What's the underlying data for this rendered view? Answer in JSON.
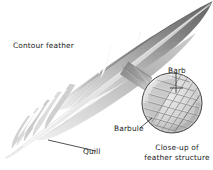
{
  "figure": {
    "background_color": "#ffffff",
    "width": 213,
    "height": 170
  },
  "labels": {
    "contour_feather": "Contour feather",
    "barb": "Barb",
    "barbule": "Barbule",
    "quill": "Quill"
  },
  "caption": {
    "line1": "Close-up of",
    "line2": "feather structure"
  },
  "colors": {
    "ink": "#1a1a1a",
    "vane_dark": "#6e6e6e",
    "vane_mid": "#9d9d9d",
    "vane_light": "#d8d8d8",
    "vane_highlight": "#f2f2f2",
    "rachis": "#e8e8e8",
    "outline": "#555555",
    "leader": "#202020",
    "wedge_dark": "#5a5a5a"
  },
  "parts": {
    "feather": "contour-feather",
    "magnifier": "close-up-circle",
    "connector": "magnifier-wedge"
  }
}
